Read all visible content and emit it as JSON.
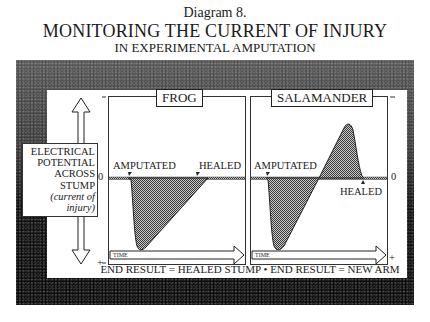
{
  "title": {
    "line1": "Diagram 8.",
    "line2": "MONITORING THE CURRENT OF INJURY",
    "line3": "IN EXPERIMENTAL AMPUTATION"
  },
  "y_axis": {
    "label_lines": [
      "ELECTRICAL",
      "POTENTIAL",
      "ACROSS",
      "STUMP"
    ],
    "label_italic_lines": [
      "(current of",
      "injury)"
    ],
    "top_sign": "−",
    "zero": "0",
    "bottom_sign": "+"
  },
  "panels": [
    {
      "title": "FROG",
      "event_start": "AMPUTATED",
      "event_end": "HEALED",
      "time_label": "TIME",
      "result": "END RESULT = HEALED STUMP"
    },
    {
      "title": "SALAMANDER",
      "event_start": "AMPUTATED",
      "event_end": "HEALED",
      "time_label": "TIME",
      "result": "END RESULT = NEW ARM"
    }
  ],
  "footer": {
    "text": "END RESULT = HEALED STUMP • END RESULT = NEW ARM"
  },
  "colors": {
    "ink": "#1a1a1a",
    "fill": "#8a8a8a",
    "frame_dark": "#0b0b0b"
  }
}
